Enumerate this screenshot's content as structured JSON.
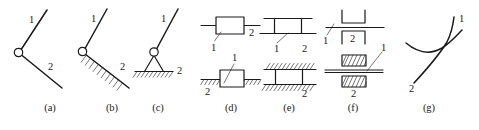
{
  "figure": {
    "background_color": "#ffffff",
    "line_color": "#1a1a1a",
    "panel_count": 7
  },
  "captions": [
    {
      "id": "a",
      "label": "(a)",
      "x": 50
    },
    {
      "id": "b",
      "label": "(b)",
      "x": 112
    },
    {
      "id": "c",
      "label": "(c)",
      "x": 158
    },
    {
      "id": "d",
      "label": "(d)",
      "x": 231
    },
    {
      "id": "e",
      "label": "(e)",
      "x": 289
    },
    {
      "id": "f",
      "label": "(f)",
      "x": 353
    },
    {
      "id": "g",
      "label": "(g)",
      "x": 429
    }
  ],
  "panels": {
    "a": {
      "caption": "(a)",
      "type": "revolute-pair-free",
      "description": "Two links joined by a pin joint, both links free",
      "link_labels": {
        "upper": "1",
        "lower": "2"
      }
    },
    "b": {
      "caption": "(b)",
      "type": "revolute-pair-hatched-link",
      "description": "Pin joint where lower link is shown hatched (fixed)",
      "link_labels": {
        "upper": "1",
        "lower": "2"
      }
    },
    "c": {
      "caption": "(c)",
      "type": "revolute-pair-grounded",
      "description": "Pin joint on a triangular support resting on hatched ground",
      "link_labels": {
        "upper": "1",
        "lower": "2"
      }
    },
    "d": {
      "caption": "(d)",
      "type": "prismatic-pair-block",
      "description": "Slider block on a guide bar; lower variant grounded on hatched surface",
      "link_labels": {
        "upper_left": "1",
        "upper_right": "2",
        "lower_upper": "1",
        "lower_left": "2"
      }
    },
    "e": {
      "caption": "(e)",
      "type": "prismatic-pair-double-rail",
      "description": "Slider between two parallel rails; lower variant rails hatched as ground",
      "link_labels": {
        "upper_left": "1",
        "upper_right": "2",
        "lower_left": "1",
        "lower_right": "2"
      }
    },
    "f": {
      "caption": "(f)",
      "type": "prismatic-pair-channel",
      "description": "Guide bar passing through upper and lower channel brackets; lower variant hatched",
      "link_labels": {
        "upper_left": "1",
        "upper_mid": "2",
        "lower_right": "1",
        "lower_mid": "2"
      }
    },
    "g": {
      "caption": "(g)",
      "type": "higher-pair-curve-contact",
      "description": "Two curved profiles in tangential point contact (higher pair)",
      "link_labels": {
        "upper": "1",
        "lower": "2"
      }
    }
  }
}
